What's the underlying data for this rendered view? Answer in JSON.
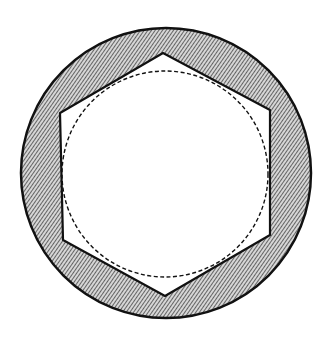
{
  "figure": {
    "colors": {
      "background": "#ffffff",
      "ink": "#111111",
      "hatch": "#3a3a3a",
      "hatch_fill": "#c8c8c8"
    },
    "outer_circle": {
      "cx": 166,
      "cy": 173,
      "r": 145
    },
    "hexagon": {
      "points": "163,53 270,110 270,235 165,296 63,240 60,113"
    },
    "dashed_circle": {
      "cx": 165,
      "cy": 174,
      "r": 103
    }
  }
}
